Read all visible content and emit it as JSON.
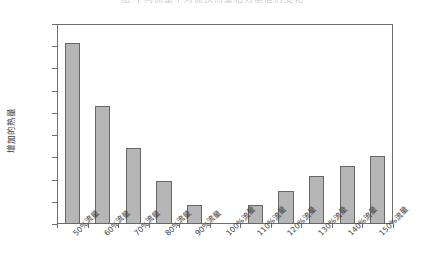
{
  "chart_data": {
    "type": "bar",
    "title": "图  不同流量下对流换热量相对基准的变化",
    "xlabel": "",
    "ylabel": "增加的热量",
    "categories": [
      "50%流量",
      "60%流量",
      "70%流量",
      "80%流量",
      "90%流量",
      "100%流量",
      "110%流量",
      "120%流量",
      "130%流量",
      "140%流量",
      "150%流量"
    ],
    "values": [
      8.15,
      5.3,
      3.4,
      1.95,
      0.85,
      0.0,
      0.85,
      1.5,
      2.15,
      2.6,
      3.05
    ],
    "ylim": [
      0,
      9
    ],
    "ytick_labels": [
      "0.0%",
      "1.0%",
      "2.0%",
      "3.0%",
      "4.0%",
      "5.0%",
      "6.0%",
      "7.0%",
      "8.0%",
      "9.0%"
    ],
    "ytick_values": [
      0,
      1,
      2,
      3,
      4,
      5,
      6,
      7,
      8,
      9
    ],
    "grid": false,
    "legend": "none",
    "bar_fill_color": "#b6b6b6",
    "bar_border_color": "#666666",
    "axis_color": "#6e6e6e",
    "background_color": "#ffffff"
  }
}
